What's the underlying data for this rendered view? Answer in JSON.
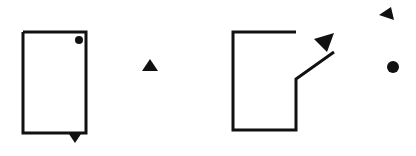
{
  "diagram": {
    "width": 416,
    "height": 156,
    "background": "#ffffff",
    "ink": "#111111",
    "stroke_width": 3,
    "figures": [
      {
        "id": "left-figure",
        "kind": "closed-rectangle",
        "outline": [
          [
            23,
            32
          ],
          [
            86,
            32
          ],
          [
            86,
            133
          ],
          [
            23,
            133
          ]
        ],
        "dot": {
          "cx": 79,
          "cy": 40,
          "r": 4
        },
        "marker": {
          "shape": "triangle-down",
          "points": [
            [
              69,
              134
            ],
            [
              81,
              134
            ],
            [
              75,
              143
            ]
          ]
        }
      },
      {
        "id": "middle-marker",
        "kind": "lone-triangle",
        "marker": {
          "shape": "triangle-up",
          "points": [
            [
              142,
              71
            ],
            [
              158,
              71
            ],
            [
              150,
              59
            ]
          ]
        }
      },
      {
        "id": "right-figure",
        "kind": "open-bent-rectangle",
        "outline": [
          [
            296,
            32
          ],
          [
            233,
            32
          ],
          [
            233,
            130
          ],
          [
            296,
            130
          ],
          [
            296,
            79
          ],
          [
            334,
            52
          ]
        ],
        "marker": {
          "shape": "triangle-down-right",
          "points": [
            [
              314,
              39
            ],
            [
              334,
              33
            ],
            [
              327,
              52
            ]
          ]
        }
      },
      {
        "id": "far-right-markers",
        "kind": "lone-marks",
        "marker": {
          "shape": "triangle-up-left",
          "points": [
            [
              379,
              15
            ],
            [
              391,
              7
            ],
            [
              394,
              20
            ]
          ]
        },
        "dot": {
          "cx": 393,
          "cy": 67,
          "r": 6
        }
      }
    ]
  }
}
